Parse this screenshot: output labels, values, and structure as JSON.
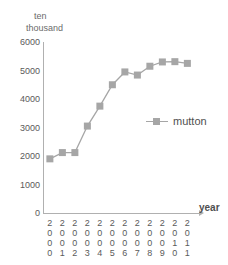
{
  "chart_data": {
    "type": "line",
    "title": "",
    "xlabel": "year",
    "ylabel": "ten thousand",
    "ylabel_lines": [
      "ten",
      "thousand"
    ],
    "categories": [
      "2000",
      "2001",
      "2002",
      "2003",
      "2004",
      "2005",
      "2006",
      "2007",
      "2008",
      "2009",
      "2010",
      "2011"
    ],
    "series": [
      {
        "name": "mutton",
        "color": "#a6a6a6",
        "marker": "square",
        "values": [
          1900,
          2120,
          2120,
          3050,
          3750,
          4500,
          4950,
          4840,
          5150,
          5300,
          5310,
          5250
        ]
      }
    ],
    "yticks": [
      0,
      1000,
      2000,
      3000,
      4000,
      5000,
      6000
    ],
    "ytick_labels": [
      "0",
      "1000",
      "2000",
      "3000",
      "4000",
      "5000",
      "6000"
    ],
    "ylim": [
      0,
      6000
    ],
    "grid": false,
    "legend_position": "center-right"
  },
  "legend": {
    "entries": [
      {
        "label": "mutton"
      }
    ]
  },
  "axes": {
    "x_title": "year",
    "y_unit_line1": "ten",
    "y_unit_line2": "thousand"
  }
}
